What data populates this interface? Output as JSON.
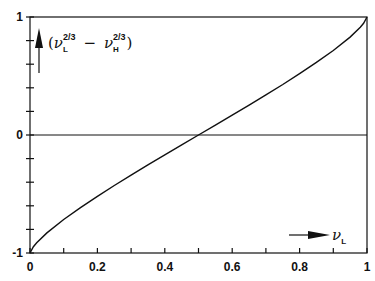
{
  "chart_data": {
    "type": "line",
    "title": "",
    "xlabel": "ν_L",
    "ylabel": "(ν_L^{2/3} − ν_H^{2/3})",
    "ylabel_parts": {
      "open": "(",
      "nu1": "ν",
      "sub1": "L",
      "sup1": "2/3",
      "minus": "−",
      "nu2": "ν",
      "sub2": "H",
      "sup2": "2/3",
      "close": ")"
    },
    "xlabel_parts": {
      "nu": "ν",
      "sub": "L"
    },
    "xlim": [
      0,
      1
    ],
    "ylim": [
      -1,
      1
    ],
    "x_ticks": [
      0,
      0.2,
      0.4,
      0.6,
      0.8,
      1
    ],
    "x_tick_labels": [
      "0",
      "0.2",
      "0.4",
      "0.6",
      "0.8",
      "1"
    ],
    "y_ticks": [
      -1,
      0,
      1
    ],
    "y_tick_labels": [
      "-1",
      "0",
      "1"
    ],
    "x_minor_step": 0.1,
    "y_minor_step": 0.2,
    "grid": false,
    "zero_line": true,
    "series": [
      {
        "name": "ν_L^(2/3) − (1−ν_L)^(2/3)",
        "x": [
          0,
          0.01,
          0.02,
          0.05,
          0.1,
          0.15,
          0.2,
          0.25,
          0.3,
          0.35,
          0.4,
          0.45,
          0.5,
          0.55,
          0.6,
          0.65,
          0.7,
          0.75,
          0.8,
          0.85,
          0.9,
          0.95,
          0.98,
          0.99,
          1
        ],
        "values": [
          -1,
          -0.947,
          -0.913,
          -0.83,
          -0.716,
          -0.615,
          -0.52,
          -0.428,
          -0.34,
          -0.253,
          -0.168,
          -0.084,
          0,
          0.084,
          0.168,
          0.253,
          0.34,
          0.428,
          0.52,
          0.615,
          0.716,
          0.83,
          0.913,
          0.947,
          1
        ]
      }
    ]
  }
}
